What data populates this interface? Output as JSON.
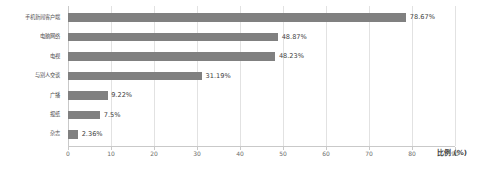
{
  "chart_data": {
    "type": "bar",
    "orientation": "horizontal",
    "title": "",
    "xlabel": "比例 (%)",
    "ylabel": "",
    "xlim": [
      0,
      90
    ],
    "grid": true,
    "legend": "none",
    "categories": [
      "手机新闻客户端",
      "电脑网络",
      "电视",
      "与别人交谈",
      "广播",
      "报纸",
      "杂志"
    ],
    "values": [
      78.67,
      48.87,
      48.23,
      31.19,
      9.22,
      7.5,
      2.36
    ],
    "value_labels": [
      "78.67%",
      "48.87%",
      "48.23%",
      "31.19%",
      "9.22%",
      "7.5%",
      "2.36%"
    ],
    "xticks": [
      0,
      10,
      20,
      30,
      40,
      50,
      60,
      70,
      80,
      90
    ],
    "xtick_labels": [
      "0",
      "10",
      "20",
      "30",
      "40",
      "50",
      "60",
      "70",
      "80",
      "90"
    ],
    "bar_color": "#808080",
    "grid_color": "#e2e2e2",
    "axis_color": "#c9c9c9",
    "text_color": "#4d4d4d"
  }
}
